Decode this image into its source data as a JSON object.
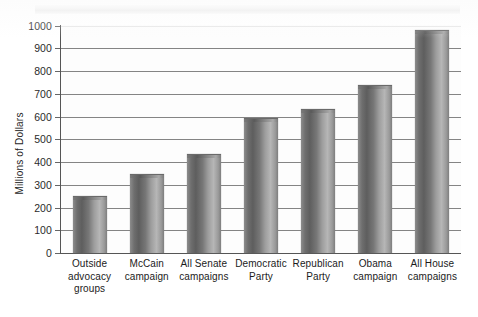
{
  "chart_data": {
    "type": "bar",
    "title": "",
    "xlabel": "",
    "ylabel": "Millions of Dollars",
    "ylim": [
      0,
      1000
    ],
    "ytick_step": 100,
    "grid": true,
    "legend": "none",
    "orientation": "vertical",
    "categories": [
      "Outside advocacy groups",
      "McCain campaign",
      "All Senate campaigns",
      "Democratic Party",
      "Republican Party",
      "Obama campaign",
      "All House campaigns"
    ],
    "category_lines": [
      [
        "Outside",
        "advocacy",
        "groups"
      ],
      [
        "McCain",
        "campaign"
      ],
      [
        "All Senate",
        "campaigns"
      ],
      [
        "Democratic",
        "Party"
      ],
      [
        "Republican",
        "Party"
      ],
      [
        "Obama",
        "campaign"
      ],
      [
        "All House",
        "campaigns"
      ]
    ],
    "values": [
      245,
      345,
      430,
      590,
      630,
      735,
      975
    ],
    "ytick_labels": [
      "1000",
      "900",
      "800",
      "700",
      "600",
      "500",
      "400",
      "300",
      "200",
      "100",
      "0"
    ],
    "ytick_values": [
      1000,
      900,
      800,
      700,
      600,
      500,
      400,
      300,
      200,
      100,
      0
    ],
    "colors": {
      "bar_dark": "#5e5e5e",
      "bar_light": "#b6b6b6",
      "gridline": "#6f6f6f",
      "axis": "#555555",
      "text": "#1b1b1b",
      "background": "#ffffff"
    }
  }
}
